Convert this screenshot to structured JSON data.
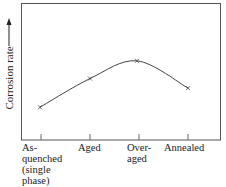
{
  "chart_data": {
    "type": "line",
    "title": "",
    "xlabel": "",
    "ylabel": "Corrosion rate",
    "ylabel_arrow": true,
    "categories": [
      "As-quenched (single phase)",
      "Aged",
      "Over-aged",
      "Annealed"
    ],
    "category_labels": [
      "As-\nquenched\n(single\nphase)",
      "Aged",
      "Over-\naged",
      "Annealed"
    ],
    "series": [
      {
        "name": "Corrosion rate",
        "values": [
          0.24,
          0.45,
          0.58,
          0.38
        ],
        "marker": "x",
        "smooth": true
      }
    ],
    "ylim": [
      0,
      1
    ],
    "y_ticks": "none (qualitative)",
    "grid": false,
    "legend": "none",
    "colors": {
      "line": "#444444",
      "frame": "#555555"
    }
  }
}
